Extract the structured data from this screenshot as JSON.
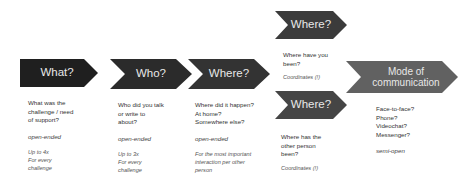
{
  "steps": [
    {
      "id": "what",
      "title": "What?",
      "color": "#1f1f1f",
      "question": "What was the\nchallenge / need\nof support?",
      "kind": "open-ended",
      "note": "Up to 4x\nFor every\nchallenge"
    },
    {
      "id": "who",
      "title": "Who?",
      "color": "#2b2b2b",
      "question": "Who did you talk\nor write to\nabout?",
      "kind": "open-ended",
      "note": "Up to 3x\nFor every\nchallenge"
    },
    {
      "id": "where",
      "title": "Where?",
      "color": "#333333",
      "question": "Where did it happen?\nAt home?\nSomewhere else?",
      "kind": "open-ended",
      "note": "For the most important\ninteraction per other\nperson"
    },
    {
      "id": "where-self",
      "title": "Where?",
      "color": "#3b3b3b",
      "question": "Where have you\nbeen?",
      "kind": "",
      "note": "Coordinates (!)"
    },
    {
      "id": "where-other",
      "title": "Where?",
      "color": "#454545",
      "question": "Where has the\nother person\nbeen?",
      "kind": "",
      "note": "Coordinates (!)"
    },
    {
      "id": "mode",
      "title": "Mode of\ncommunication",
      "color": "#616161",
      "question": "Face-to-face?\nPhone?\nVideochat?\nMessenger?",
      "kind": "semi-open",
      "note": ""
    }
  ]
}
